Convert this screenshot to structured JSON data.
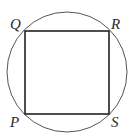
{
  "diagram": {
    "circle": {
      "cx": 67,
      "cy": 72,
      "r": 60,
      "stroke": "#555555"
    },
    "square": {
      "vertices": {
        "Q": [
          25,
          31
        ],
        "R": [
          109,
          31
        ],
        "S": [
          109,
          114
        ],
        "P": [
          25,
          114
        ]
      },
      "stroke": "#222222"
    },
    "labels": {
      "Q": "Q",
      "R": "R",
      "P": "P",
      "S": "S"
    }
  }
}
